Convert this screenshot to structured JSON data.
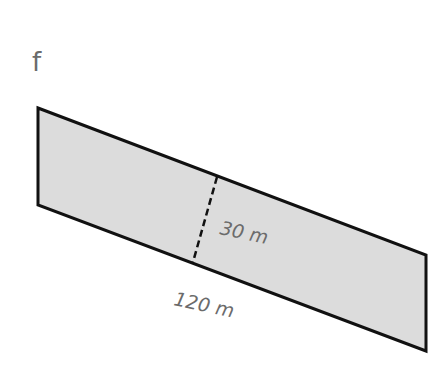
{
  "figure": {
    "label": "f",
    "shape": "parallelogram",
    "fill_color": "#dcdcdc",
    "stroke_color": "#111111",
    "base_label": "120 m",
    "height_label": "30 m"
  }
}
